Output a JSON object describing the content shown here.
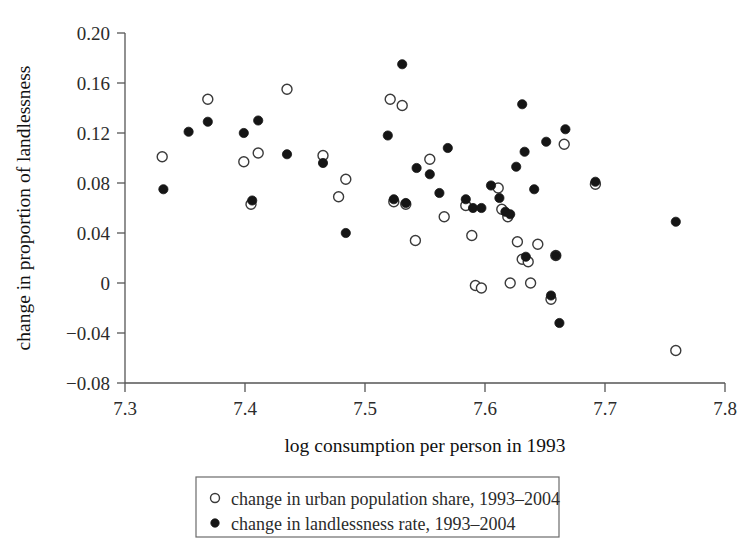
{
  "chart_data": {
    "type": "scatter",
    "title": "",
    "xlabel": "log consumption per person in 1993",
    "ylabel": "change in proportion of landlessness",
    "xlim": [
      7.3,
      7.8
    ],
    "ylim": [
      -0.08,
      0.2
    ],
    "xticks": [
      "7.3",
      "7.4",
      "7.5",
      "7.6",
      "7.7",
      "7.8"
    ],
    "xtick_values": [
      7.3,
      7.4,
      7.5,
      7.6,
      7.7,
      7.8
    ],
    "yticks": [
      "0.20",
      "0.16",
      "0.12",
      "0.08",
      "0.04",
      "0",
      "−0.04",
      "−0.08"
    ],
    "ytick_values": [
      0.2,
      0.16,
      0.12,
      0.08,
      0.04,
      0,
      -0.04,
      -0.08
    ],
    "grid": false,
    "legend_position": "below-axes",
    "series": [
      {
        "name": "change in urban population share, 1993–2004",
        "marker": "open-circle",
        "color": "#ffffff",
        "edge_color": "#3a3a3a",
        "points": [
          [
            7.331,
            0.101
          ],
          [
            7.369,
            0.147
          ],
          [
            7.399,
            0.097
          ],
          [
            7.405,
            0.063
          ],
          [
            7.411,
            0.104
          ],
          [
            7.435,
            0.155
          ],
          [
            7.465,
            0.102
          ],
          [
            7.478,
            0.069
          ],
          [
            7.484,
            0.083
          ],
          [
            7.521,
            0.147
          ],
          [
            7.524,
            0.065
          ],
          [
            7.531,
            0.142
          ],
          [
            7.534,
            0.063
          ],
          [
            7.542,
            0.034
          ],
          [
            7.554,
            0.099
          ],
          [
            7.566,
            0.053
          ],
          [
            7.584,
            0.062
          ],
          [
            7.589,
            0.038
          ],
          [
            7.592,
            -0.002
          ],
          [
            7.597,
            -0.004
          ],
          [
            7.611,
            0.076
          ],
          [
            7.614,
            0.059
          ],
          [
            7.619,
            0.053
          ],
          [
            7.621,
            0.0
          ],
          [
            7.627,
            0.033
          ],
          [
            7.631,
            0.019
          ],
          [
            7.636,
            0.017
          ],
          [
            7.638,
            0.0
          ],
          [
            7.644,
            0.031
          ],
          [
            7.655,
            -0.013
          ],
          [
            7.659,
            0.022
          ],
          [
            7.666,
            0.111
          ],
          [
            7.692,
            0.079
          ],
          [
            7.759,
            -0.054
          ]
        ]
      },
      {
        "name": "change in landlessness rate, 1993–2004",
        "marker": "filled-circle",
        "color": "#151515",
        "points": [
          [
            7.332,
            0.075
          ],
          [
            7.353,
            0.121
          ],
          [
            7.369,
            0.129
          ],
          [
            7.399,
            0.12
          ],
          [
            7.406,
            0.066
          ],
          [
            7.411,
            0.13
          ],
          [
            7.435,
            0.103
          ],
          [
            7.465,
            0.096
          ],
          [
            7.484,
            0.04
          ],
          [
            7.519,
            0.118
          ],
          [
            7.524,
            0.067
          ],
          [
            7.531,
            0.175
          ],
          [
            7.534,
            0.064
          ],
          [
            7.543,
            0.092
          ],
          [
            7.554,
            0.087
          ],
          [
            7.562,
            0.072
          ],
          [
            7.569,
            0.108
          ],
          [
            7.584,
            0.067
          ],
          [
            7.59,
            0.06
          ],
          [
            7.597,
            0.06
          ],
          [
            7.605,
            0.078
          ],
          [
            7.612,
            0.068
          ],
          [
            7.617,
            0.057
          ],
          [
            7.621,
            0.055
          ],
          [
            7.626,
            0.093
          ],
          [
            7.631,
            0.143
          ],
          [
            7.633,
            0.105
          ],
          [
            7.634,
            0.021
          ],
          [
            7.641,
            0.075
          ],
          [
            7.651,
            0.113
          ],
          [
            7.655,
            -0.01
          ],
          [
            7.659,
            0.022
          ],
          [
            7.662,
            -0.032
          ],
          [
            7.667,
            0.123
          ],
          [
            7.692,
            0.081
          ],
          [
            7.759,
            0.049
          ]
        ]
      }
    ]
  },
  "legend": {
    "entries": [
      {
        "marker": "open-circle",
        "label": "change in urban population share, 1993–2004"
      },
      {
        "marker": "filled-circle",
        "label": "change in landlessness rate, 1993–2004"
      }
    ]
  },
  "axes": {
    "x_title": "log consumption per person in 1993",
    "y_title": "change in proportion of landlessness"
  }
}
